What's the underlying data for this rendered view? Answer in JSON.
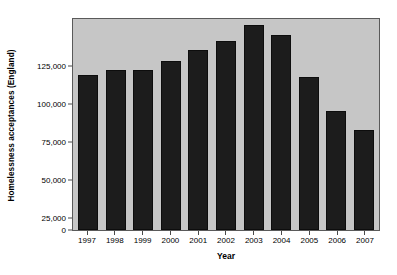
{
  "chart_data": {
    "type": "bar",
    "title": "",
    "xlabel": "Year",
    "ylabel": "Homelessness acceptances (England)",
    "categories": [
      "1997",
      "1998",
      "1999",
      "2000",
      "2001",
      "2002",
      "2003",
      "2004",
      "2005",
      "2006",
      "2007"
    ],
    "values": [
      102000,
      105000,
      105500,
      111000,
      118500,
      124000,
      135000,
      128500,
      100500,
      78000,
      66000
    ],
    "ylim": [
      0,
      140000
    ],
    "yticks": [
      0,
      25000,
      50000,
      75000,
      100000,
      125000
    ],
    "ytick_labels": [
      "0",
      "25,000",
      "50,000",
      "75,000",
      "100,000",
      "125,000"
    ],
    "grid": false,
    "legend": null,
    "colors": {
      "bar": "#1c1c1c",
      "plot_background": "#c6c6c6",
      "figure_background": "#ffffff",
      "axis": "#4a4a4a",
      "text": "#000000"
    }
  }
}
